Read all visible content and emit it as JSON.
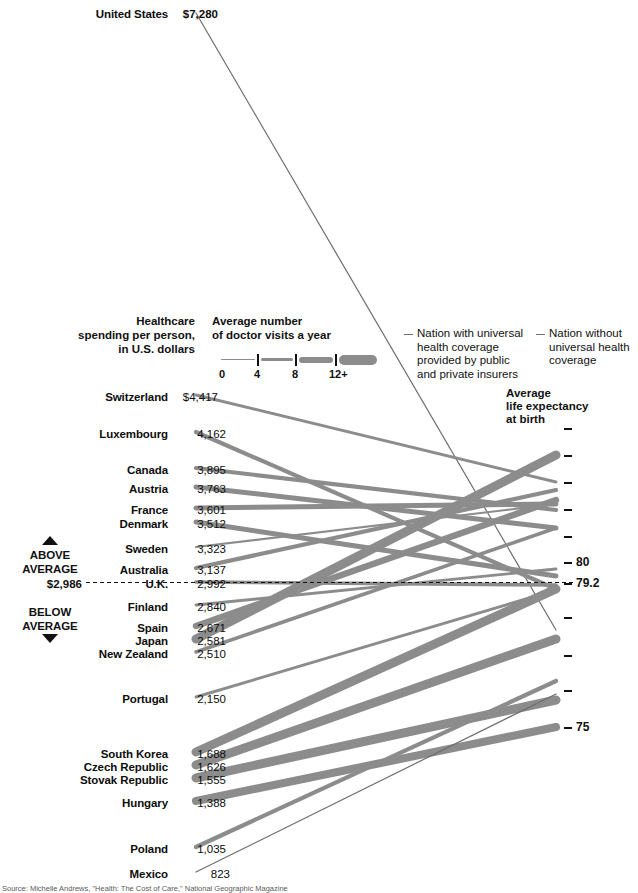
{
  "headers": {
    "spending": "Healthcare\nspending per person,\nin U.S. dollars",
    "spending_l1": "Healthcare",
    "spending_l2": "spending per person,",
    "spending_l3": "in U.S. dollars",
    "visits_l1": "Average number",
    "visits_l2": "of doctor visits a year",
    "life_l1": "Average",
    "life_l2": "life expectancy",
    "life_l3": "at birth"
  },
  "visits_legend": {
    "ticks": [
      "0",
      "4",
      "8",
      "12+"
    ]
  },
  "coverage_legend": {
    "with_l1": "Nation with universal",
    "with_l2": "health coverage",
    "with_l3": "provided by public",
    "with_l4": "and private insurers",
    "without_l1": "Nation without",
    "without_l2": "universal health",
    "without_l3": "coverage"
  },
  "average_marker": {
    "above_l1": "ABOVE",
    "above_l2": "AVERAGE",
    "below_l1": "BELOW",
    "below_l2": "AVERAGE",
    "value_label": "$2,986"
  },
  "right_axis": {
    "labels": [
      "80",
      "79.2",
      "75"
    ],
    "colors": {
      "line": "#8c8c8c",
      "thin": "#6e6e6e",
      "text": "#111111"
    }
  },
  "source": "Source: Michelle Andrews, \"Health: The Cost of Care,\" National Geographic Magazine",
  "chart_data": {
    "type": "line",
    "xlabel": "",
    "ylabel": "Healthcare spending per person, in U.S. dollars",
    "y2label": "Average life expectancy at birth",
    "legend": "Line thickness = average number of doctor visits a year (0 / 4 / 8 / 12+)",
    "y2_ticks": [
      80,
      79.2,
      75
    ],
    "average_spending": 2986,
    "series": [
      {
        "name": "United States",
        "spending": 7280,
        "life_expectancy": 78.1,
        "visits": 4,
        "universal": false
      },
      {
        "name": "Switzerland",
        "spending": 4417,
        "life_expectancy": 81.7,
        "visits": 4,
        "universal": true
      },
      {
        "name": "Luxembourg",
        "spending": 4162,
        "life_expectancy": 79.4,
        "visits": 6,
        "universal": true
      },
      {
        "name": "Canada",
        "spending": 3895,
        "life_expectancy": 80.7,
        "visits": 6,
        "universal": true
      },
      {
        "name": "Austria",
        "spending": 3763,
        "life_expectancy": 80.1,
        "visits": 7,
        "universal": true
      },
      {
        "name": "France",
        "spending": 3601,
        "life_expectancy": 81.0,
        "visits": 7,
        "universal": true
      },
      {
        "name": "Denmark",
        "spending": 3512,
        "life_expectancy": 78.4,
        "visits": 7,
        "universal": true
      },
      {
        "name": "Sweden",
        "spending": 3323,
        "life_expectancy": 81.0,
        "visits": 3,
        "universal": true
      },
      {
        "name": "Australia",
        "spending": 3137,
        "life_expectancy": 81.4,
        "visits": 6,
        "universal": true
      },
      {
        "name": "U.K.",
        "spending": 2992,
        "life_expectancy": 79.1,
        "visits": 5,
        "universal": true
      },
      {
        "name": "Finland",
        "spending": 2840,
        "life_expectancy": 79.5,
        "visits": 4,
        "universal": true
      },
      {
        "name": "Spain",
        "spending": 2671,
        "life_expectancy": 81.1,
        "visits": 9,
        "universal": true
      },
      {
        "name": "Japan",
        "spending": 2581,
        "life_expectancy": 82.6,
        "visits": 13,
        "universal": true
      },
      {
        "name": "New Zealand",
        "spending": 2510,
        "life_expectancy": 80.1,
        "visits": 5,
        "universal": true
      },
      {
        "name": "Portugal",
        "spending": 2150,
        "life_expectancy": 79.1,
        "visits": 4,
        "universal": true
      },
      {
        "name": "South Korea",
        "spending": 1688,
        "life_expectancy": 79.4,
        "visits": 13,
        "universal": true
      },
      {
        "name": "Czech Republic",
        "spending": 1626,
        "life_expectancy": 77.0,
        "visits": 13,
        "universal": true
      },
      {
        "name": "Stovak Republic",
        "spending": 1555,
        "life_expectancy": 74.3,
        "visits": 13,
        "universal": true
      },
      {
        "name": "Hungary",
        "spending": 1388,
        "life_expectancy": 73.3,
        "visits": 12,
        "universal": true
      },
      {
        "name": "Poland",
        "spending": 1035,
        "life_expectancy": 75.4,
        "visits": 6,
        "universal": true
      },
      {
        "name": "Mexico",
        "spending": 823,
        "life_expectancy": 75.0,
        "visits": 2,
        "universal": false
      }
    ]
  },
  "rows": [
    {
      "name": "United States",
      "value": "$7,280",
      "bold": true,
      "y": 8,
      "nameRight": 168,
      "valLeft": 172
    },
    {
      "name": "Switzerland",
      "value": "$4,417",
      "bold": false,
      "y": 391,
      "nameRight": 168,
      "valLeft": 172
    },
    {
      "name": "Luxembourg",
      "value": "4,162",
      "bold": false,
      "y": 428,
      "nameRight": 168,
      "valLeft": 180
    },
    {
      "name": "Canada",
      "value": "3,895",
      "bold": false,
      "y": 464,
      "nameRight": 168,
      "valLeft": 180
    },
    {
      "name": "Austria",
      "value": "3,763",
      "bold": false,
      "y": 483,
      "nameRight": 168,
      "valLeft": 180
    },
    {
      "name": "France",
      "value": "3,601",
      "bold": false,
      "y": 504,
      "nameRight": 168,
      "valLeft": 180
    },
    {
      "name": "Denmark",
      "value": "3,512",
      "bold": false,
      "y": 518,
      "nameRight": 168,
      "valLeft": 180
    },
    {
      "name": "Sweden",
      "value": "3,323",
      "bold": false,
      "y": 543,
      "nameRight": 168,
      "valLeft": 180
    },
    {
      "name": "Australia",
      "value": "3,137",
      "bold": false,
      "y": 564,
      "nameRight": 168,
      "valLeft": 180
    },
    {
      "name": "U.K.",
      "value": "2,992",
      "bold": false,
      "y": 578,
      "nameRight": 168,
      "valLeft": 180
    },
    {
      "name": "Finland",
      "value": "2,840",
      "bold": false,
      "y": 601,
      "nameRight": 168,
      "valLeft": 180
    },
    {
      "name": "Spain",
      "value": "2,671",
      "bold": false,
      "y": 622,
      "nameRight": 168,
      "valLeft": 180
    },
    {
      "name": "Japan",
      "value": "2,581",
      "bold": false,
      "y": 635,
      "nameRight": 168,
      "valLeft": 180
    },
    {
      "name": "New Zealand",
      "value": "2,510",
      "bold": false,
      "y": 648,
      "nameRight": 168,
      "valLeft": 180
    },
    {
      "name": "Portugal",
      "value": "2,150",
      "bold": false,
      "y": 693,
      "nameRight": 168,
      "valLeft": 180
    },
    {
      "name": "South Korea",
      "value": "1,688",
      "bold": false,
      "y": 748,
      "nameRight": 168,
      "valLeft": 180
    },
    {
      "name": "Czech Republic",
      "value": "1,626",
      "bold": false,
      "y": 761,
      "nameRight": 168,
      "valLeft": 180
    },
    {
      "name": "Stovak Republic",
      "value": "1,555",
      "bold": false,
      "y": 774,
      "nameRight": 168,
      "valLeft": 180
    },
    {
      "name": "Hungary",
      "value": "1,388",
      "bold": false,
      "y": 797,
      "nameRight": 168,
      "valLeft": 180
    },
    {
      "name": "Poland",
      "value": "1,035",
      "bold": false,
      "y": 843,
      "nameRight": 168,
      "valLeft": 180
    },
    {
      "name": "Mexico",
      "value": "823",
      "bold": false,
      "y": 868,
      "nameRight": 168,
      "valLeft": 184
    }
  ],
  "geometry": {
    "x_left": 196,
    "x_right": 556,
    "left_y": [
      13,
      395,
      432,
      468,
      487,
      508,
      522,
      547,
      568,
      582,
      605,
      626,
      639,
      652,
      697,
      752,
      765,
      778,
      801,
      847,
      872
    ],
    "right_y": [
      630,
      482,
      589,
      510,
      528,
      504,
      576,
      504,
      490,
      585,
      569,
      500,
      455,
      528,
      590,
      589,
      639,
      700,
      727,
      681,
      694
    ],
    "widths": [
      1.2,
      2.9,
      4.2,
      4.2,
      5.0,
      5.0,
      5.0,
      2.2,
      4.2,
      3.6,
      2.9,
      6.4,
      9.0,
      3.6,
      2.9,
      9.0,
      9.0,
      9.0,
      8.0,
      4.2,
      1.2
    ],
    "ticks_y": [
      428,
      455,
      482,
      509,
      536,
      562,
      583,
      617,
      655,
      690,
      727
    ]
  }
}
